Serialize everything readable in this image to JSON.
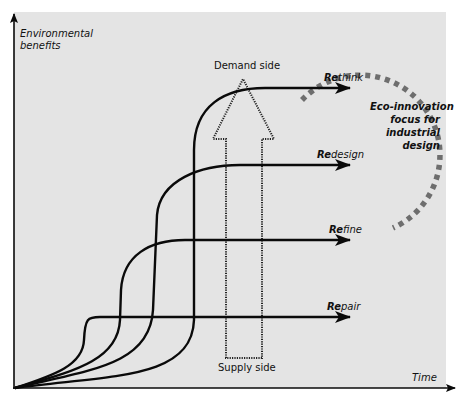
{
  "axes": {
    "y_label_line1": "Environmental",
    "y_label_line2": "benefits",
    "x_label": "Time"
  },
  "stages": [
    {
      "id": "rethink",
      "prefix": "Re",
      "rest": "think",
      "label": "Rethink",
      "y": 88
    },
    {
      "id": "redesign",
      "prefix": "Re",
      "rest": "design",
      "label": "Redesign",
      "y": 165
    },
    {
      "id": "refine",
      "prefix": "Re",
      "rest": "fine",
      "label": "Refine",
      "y": 240
    },
    {
      "id": "repair",
      "prefix": "Re",
      "rest": "pair",
      "label": "Repair",
      "y": 317
    }
  ],
  "arrow": {
    "top_label": "Demand side",
    "bottom_label": "Supply side"
  },
  "focus": {
    "line1": "Eco-innovation",
    "line2": "focus for",
    "line3": "industrial",
    "line4": "design"
  },
  "colors": {
    "panel": "#e4e4e4",
    "curve": "#0a0a0a",
    "dashed_circle": "#6e6e6e",
    "dotted_arrow": "#222222"
  }
}
